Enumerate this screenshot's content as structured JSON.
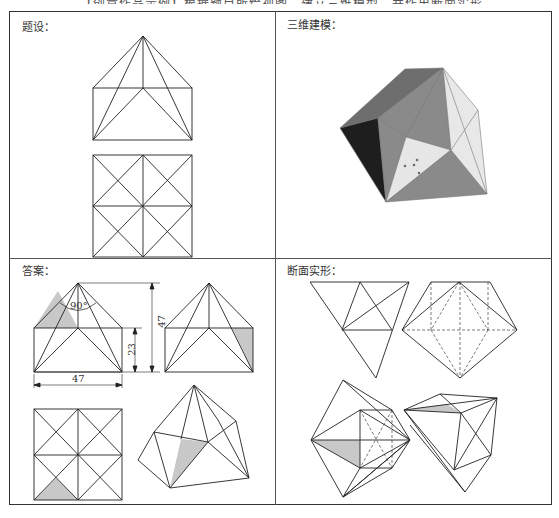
{
  "header": {
    "caption": "【创意作品示例】根据题目所给视图，建立三维模型，并作出断面实形。"
  },
  "panels": {
    "given": {
      "label": "题设："
    },
    "model3d": {
      "label": "三维建模："
    },
    "answer": {
      "label": "答案：",
      "dimensions": {
        "angle": "90°",
        "height_total": "47",
        "height_box": "23",
        "width": "47"
      }
    },
    "sections": {
      "label": "断面实形："
    }
  },
  "colors": {
    "line": "#222222",
    "shade": "#c8c8c8",
    "dark_face": "#1e1e1e",
    "mid_face": "#8a8a8a",
    "light_face": "#e6e6e6",
    "top_face": "#6e6e6e"
  }
}
